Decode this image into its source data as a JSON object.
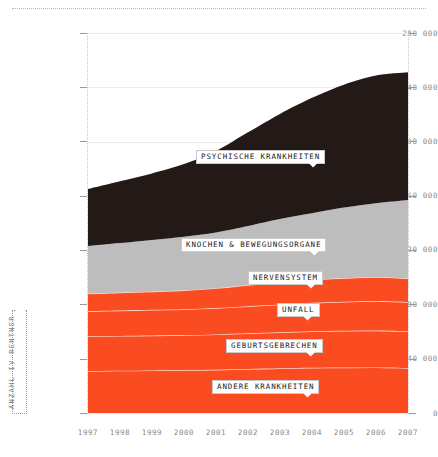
{
  "chart_data": {
    "type": "area",
    "stacked": true,
    "title": "",
    "subtitle": "",
    "xlabel": "",
    "ylabel": "ANZAHL IV-RENTNER",
    "x": [
      1997,
      1998,
      1999,
      2000,
      2001,
      2002,
      2003,
      2004,
      2005,
      2006,
      2007
    ],
    "categories": [
      "1997",
      "1998",
      "1999",
      "2000",
      "2001",
      "2002",
      "2003",
      "2004",
      "2005",
      "2006",
      "2007"
    ],
    "xlim": [
      1997,
      2007
    ],
    "ylim": [
      0,
      280000
    ],
    "yticks": [
      0,
      40000,
      80000,
      120000,
      160000,
      200000,
      240000,
      280000
    ],
    "ytick_labels": [
      "0",
      "40 000",
      "80 000",
      "120 000",
      "160 000",
      "200 000",
      "240 000",
      "280 000"
    ],
    "grid": true,
    "legend": "inline-callouts",
    "series": [
      {
        "name": "ANDERE KRANKHEITEN",
        "color": "#fb4b20",
        "values": [
          31000,
          31200,
          31400,
          31600,
          31900,
          32400,
          32900,
          33300,
          33500,
          33600,
          33200
        ]
      },
      {
        "name": "GEBURTSGEBRECHEN",
        "color": "#fb4b20",
        "values": [
          25500,
          25600,
          25700,
          25800,
          26000,
          26300,
          26600,
          26900,
          27100,
          27200,
          27000
        ]
      },
      {
        "name": "UNFALL",
        "color": "#fb4b20",
        "values": [
          18500,
          18700,
          18900,
          19100,
          19500,
          20000,
          20500,
          21000,
          21400,
          21700,
          21500
        ]
      },
      {
        "name": "NERVENSYSTEM",
        "color": "#fb4b20",
        "values": [
          13000,
          13200,
          13500,
          13900,
          14600,
          15600,
          16400,
          17000,
          17400,
          17600,
          17500
        ]
      },
      {
        "name": "KNOCHEN & BEWEGUNGSORGANE",
        "color": "#bdbdbd",
        "values": [
          35000,
          36500,
          38000,
          39500,
          41000,
          43500,
          46500,
          49000,
          52000,
          54500,
          57800
        ]
      },
      {
        "name": "PSYCHISCHE KRANKHEITEN",
        "color": "#231a17",
        "values": [
          42000,
          45500,
          49000,
          53500,
          60000,
          69000,
          77500,
          85000,
          90500,
          94000,
          94000
        ]
      }
    ],
    "totals": [
      165000,
      170700,
      176500,
      183400,
      193000,
      206800,
      220400,
      232200,
      241900,
      248600,
      251000
    ]
  },
  "axis": {
    "y_title": "ANZAHL IV-RENTNER",
    "y_tick_labels": [
      "280 000",
      "240 000",
      "200 000",
      "160 000",
      "120 000",
      "80 000",
      "40 000",
      "0"
    ],
    "x_tick_labels": [
      "1997",
      "1998",
      "1999",
      "2000",
      "2001",
      "2002",
      "2003",
      "2004",
      "2005",
      "2006",
      "2007"
    ]
  },
  "callouts": [
    {
      "id": "psychische",
      "label": "PSYCHISCHE KRANKHEITEN"
    },
    {
      "id": "knochen",
      "label": "KNOCHEN & BEWEGUNGSORGANE"
    },
    {
      "id": "nervensystem",
      "label": "NERVENSYSTEM"
    },
    {
      "id": "unfall",
      "label": "UNFALL"
    },
    {
      "id": "geburtsgebrechen",
      "label": "GEBURTSGEBRECHEN"
    },
    {
      "id": "andere",
      "label": "ANDERE KRANKHEITEN"
    }
  ],
  "colors": {
    "red": "#fb4b20",
    "gray": "#bdbdbd",
    "black": "#231a17",
    "grid": "#ececec",
    "tick_text": "#8a8a8a",
    "background": "#ffffff"
  }
}
